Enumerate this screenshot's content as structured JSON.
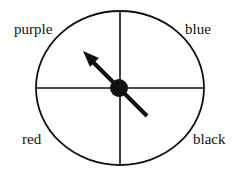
{
  "diagram": {
    "type": "spinner",
    "sections": [
      {
        "label": "purple",
        "position": "top-left"
      },
      {
        "label": "blue",
        "position": "top-right"
      },
      {
        "label": "red",
        "position": "bottom-left"
      },
      {
        "label": "black",
        "position": "bottom-right"
      }
    ],
    "arrow_pointing_to": "purple"
  }
}
